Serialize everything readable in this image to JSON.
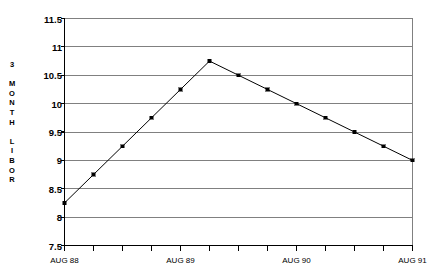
{
  "chart_data": {
    "type": "line",
    "title": "",
    "xlabel": "",
    "ylabel": "3 MONTH LIBOR",
    "ylabel_chars": [
      "3",
      "",
      "M",
      "O",
      "N",
      "T",
      "H",
      "",
      "L",
      "I",
      "B",
      "O",
      "R"
    ],
    "ylim": [
      7.5,
      11.5
    ],
    "ytick_values": [
      11.5,
      11,
      10.5,
      10,
      9.5,
      9,
      8.5,
      8,
      7.5
    ],
    "ytick_labels": [
      "11.5",
      "11",
      "10.5",
      "10",
      "9.5",
      "9",
      "8.5",
      "8",
      "7.5"
    ],
    "grid": true,
    "grid_color": "#808080",
    "legend": "none",
    "line_color": "#000000",
    "marker_color": "#000000",
    "frame_color": "#808080",
    "axis_color": "#000000",
    "xlim": [
      0,
      12
    ],
    "xtick_positions": [
      0,
      1,
      2,
      3,
      4,
      5,
      6,
      7,
      8,
      9,
      10,
      11,
      12
    ],
    "xtick_labels": [
      {
        "pos": 0,
        "label": "AUG 88"
      },
      {
        "pos": 4,
        "label": "AUG 89"
      },
      {
        "pos": 8,
        "label": "AUG 90"
      },
      {
        "pos": 12,
        "label": "AUG 91"
      }
    ],
    "x": [
      0,
      1,
      2,
      3,
      4,
      5,
      6,
      7,
      8,
      9,
      10,
      11,
      12
    ],
    "values": [
      8.25,
      8.75,
      9.25,
      9.75,
      10.25,
      10.75,
      10.5,
      10.25,
      10.0,
      9.75,
      9.5,
      9.25,
      9.0
    ],
    "series": [
      {
        "name": "3 MONTH LIBOR",
        "values": [
          8.25,
          8.75,
          9.25,
          9.75,
          10.25,
          10.75,
          10.5,
          10.25,
          10.0,
          9.75,
          9.5,
          9.25,
          9.0
        ]
      }
    ]
  }
}
